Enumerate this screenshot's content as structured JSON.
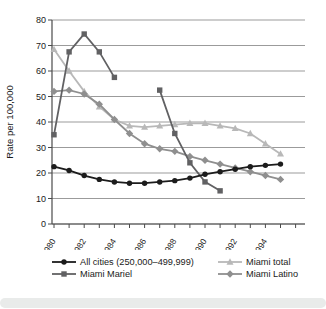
{
  "page": {
    "background": "#ffffff",
    "bottom_strip_color": "#e9ebea"
  },
  "chart_data": {
    "type": "line",
    "title": "",
    "xlabel": "",
    "ylabel": "Rate per 100,000",
    "ylim": [
      0,
      80
    ],
    "yticks": [
      0,
      10,
      20,
      30,
      40,
      50,
      60,
      70,
      80
    ],
    "x": [
      1980,
      1981,
      1982,
      1983,
      1984,
      1985,
      1986,
      1987,
      1988,
      1989,
      1990,
      1991,
      1992,
      1993,
      1994,
      1995
    ],
    "xtick_labeled_years": [
      1980,
      1982,
      1984,
      1986,
      1988,
      1990,
      1992,
      1994
    ],
    "xtick_minor_every_year": true,
    "grid": "horizontal",
    "grid_color": "#9b9b9b",
    "axis_color": "#4a4a4a",
    "text_color": "#1a1a1a",
    "legend_position": "bottom",
    "series": [
      {
        "name": "All cities (250,000–499,999)",
        "marker": "circle",
        "color": "#1c1c1c",
        "values": [
          22.5,
          21,
          19,
          17.5,
          16.5,
          16,
          16,
          16.5,
          17,
          18,
          19.5,
          20.5,
          21.5,
          22.5,
          23,
          23.5
        ]
      },
      {
        "name": "Miami total",
        "marker": "triangle",
        "color": "#b8b8b8",
        "values": [
          68.5,
          60,
          52,
          46,
          41,
          38.5,
          38,
          38.5,
          39,
          39.5,
          39.5,
          38.5,
          37.5,
          35.5,
          31.5,
          27.5
        ]
      },
      {
        "name": "Miami Mariel",
        "marker": "square",
        "color": "#616163",
        "values": [
          35,
          67.5,
          74.5,
          67.5,
          57.5,
          null,
          null,
          52.5,
          35.5,
          24,
          16.5,
          13,
          null,
          null,
          null,
          null
        ]
      },
      {
        "name": "Miami Latino",
        "marker": "diamond",
        "color": "#8f8f8f",
        "values": [
          52,
          52.5,
          51,
          47,
          41,
          35.5,
          31.5,
          29.5,
          28.5,
          26.5,
          25,
          23.5,
          22,
          20.5,
          19,
          17.5
        ]
      }
    ]
  }
}
